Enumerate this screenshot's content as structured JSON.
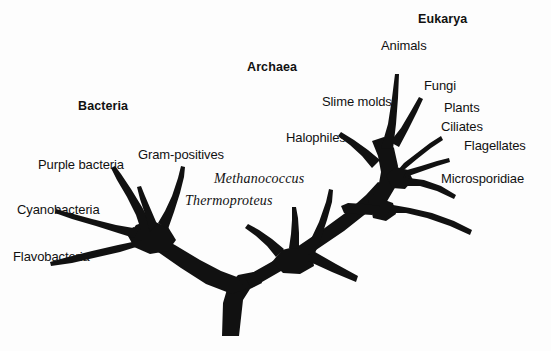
{
  "figure": {
    "background_color": "#fdfdfd",
    "ink_color": "#111111"
  },
  "domains": [
    {
      "id": "bacteria",
      "label": "Bacteria",
      "x": 78,
      "y": 100
    },
    {
      "id": "archaea",
      "label": "Archaea",
      "x": 247,
      "y": 61
    },
    {
      "id": "eukarya",
      "label": "Eukarya",
      "x": 418,
      "y": 13
    }
  ],
  "taxa": [
    {
      "id": "purple-bacteria",
      "label": "Purple bacteria",
      "domain": "bacteria",
      "x": 38,
      "y": 158,
      "style": "roman"
    },
    {
      "id": "gram-positives",
      "label": "Gram-positives",
      "domain": "bacteria",
      "x": 138,
      "y": 148,
      "style": "roman"
    },
    {
      "id": "cyanobacteria",
      "label": "Cyanobacteria",
      "domain": "bacteria",
      "x": 17,
      "y": 203,
      "style": "roman"
    },
    {
      "id": "flavobacteria",
      "label": "Flavobacteria",
      "domain": "bacteria",
      "x": 13,
      "y": 250,
      "style": "roman"
    },
    {
      "id": "methanococcus",
      "label": "Methanococcus",
      "domain": "archaea",
      "x": 214,
      "y": 172,
      "style": "italic"
    },
    {
      "id": "thermoproteus",
      "label": "Thermoproteus",
      "domain": "archaea",
      "x": 185,
      "y": 194,
      "style": "italic"
    },
    {
      "id": "halophiles",
      "label": "Halophiles",
      "domain": "archaea",
      "x": 286,
      "y": 131,
      "style": "roman"
    },
    {
      "id": "slime-molds",
      "label": "Slime molds",
      "domain": "eukarya",
      "x": 322,
      "y": 95,
      "style": "roman"
    },
    {
      "id": "animals",
      "label": "Animals",
      "domain": "eukarya",
      "x": 381,
      "y": 39,
      "style": "roman"
    },
    {
      "id": "fungi",
      "label": "Fungi",
      "domain": "eukarya",
      "x": 424,
      "y": 79,
      "style": "roman"
    },
    {
      "id": "plants",
      "label": "Plants",
      "domain": "eukarya",
      "x": 444,
      "y": 101,
      "style": "roman"
    },
    {
      "id": "ciliates",
      "label": "Ciliates",
      "domain": "eukarya",
      "x": 441,
      "y": 120,
      "style": "roman"
    },
    {
      "id": "flagellates",
      "label": "Flagellates",
      "domain": "eukarya",
      "x": 464,
      "y": 139,
      "style": "roman"
    },
    {
      "id": "microsporidiae",
      "label": "Microsporidiae",
      "domain": "eukarya",
      "x": 441,
      "y": 172,
      "style": "roman"
    }
  ],
  "tree_geometry": {
    "root": {
      "x": 231,
      "y": 336
    },
    "basal_node": {
      "x": 236,
      "y": 286
    },
    "bacteria_node": {
      "x": 150,
      "y": 239
    },
    "archaea_node": {
      "x": 296,
      "y": 243
    },
    "eukarya_node": {
      "x": 385,
      "y": 183
    }
  }
}
